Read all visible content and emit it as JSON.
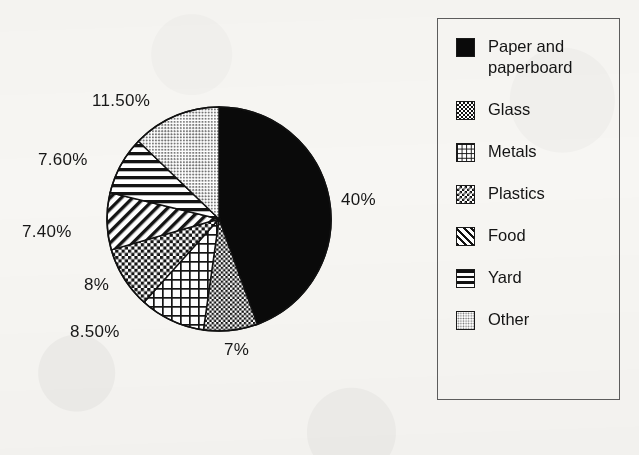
{
  "chart_data": {
    "type": "pie",
    "title": "",
    "categories": [
      "Paper and paperboard",
      "Glass",
      "Metals",
      "Plastics",
      "Food",
      "Yard",
      "Other"
    ],
    "values": [
      40,
      7,
      8.5,
      8,
      7.4,
      7.6,
      11.5
    ],
    "value_labels": [
      "40%",
      "7%",
      "8.50%",
      "8%",
      "7.40%",
      "7.60%",
      "11.50%"
    ],
    "units": "percent",
    "start_angle_deg": 0,
    "direction": "clockwise",
    "legend_position": "right",
    "grid": false,
    "patterns": [
      "solid-black",
      "checker-dense",
      "grid",
      "checker",
      "diagonal-stripes",
      "horizontal-stripes",
      "light-dots"
    ]
  },
  "pie": {
    "center_x": 219,
    "center_y": 219,
    "radius": 112,
    "outline_color": "#111111",
    "slices": [
      {
        "name": "Paper and paperboard",
        "percent": 40,
        "label": "40%",
        "pattern": "solid-black",
        "label_x": 341,
        "label_y": 190
      },
      {
        "name": "Glass",
        "percent": 7,
        "label": "7%",
        "pattern": "checker-dense",
        "label_x": 224,
        "label_y": 340
      },
      {
        "name": "Metals",
        "percent": 8.5,
        "label": "8.50%",
        "pattern": "grid",
        "label_x": 70,
        "label_y": 322
      },
      {
        "name": "Plastics",
        "percent": 8,
        "label": "8%",
        "pattern": "checker",
        "label_x": 84,
        "label_y": 275
      },
      {
        "name": "Food",
        "percent": 7.4,
        "label": "7.40%",
        "pattern": "diagonal-stripes",
        "label_x": 22,
        "label_y": 222
      },
      {
        "name": "Yard",
        "percent": 7.6,
        "label": "7.60%",
        "pattern": "horizontal-stripes",
        "label_x": 38,
        "label_y": 150
      },
      {
        "name": "Other",
        "percent": 11.5,
        "label": "11.50%",
        "pattern": "light-dots",
        "label_x": 92,
        "label_y": 91
      }
    ]
  },
  "legend": {
    "items": [
      {
        "label": "Paper and paperboard",
        "swatch": "solid-black"
      },
      {
        "label": "Glass",
        "swatch": "checker-dense"
      },
      {
        "label": "Metals",
        "swatch": "grid"
      },
      {
        "label": "Plastics",
        "swatch": "checker"
      },
      {
        "label": "Food",
        "swatch": "diagonal-stripes"
      },
      {
        "label": "Yard",
        "swatch": "horizontal-stripes"
      },
      {
        "label": "Other",
        "swatch": "light-dots"
      }
    ],
    "border_color": "#5d5d5d"
  },
  "colors": {
    "background": "#f7f6f3",
    "ink": "#141414"
  }
}
